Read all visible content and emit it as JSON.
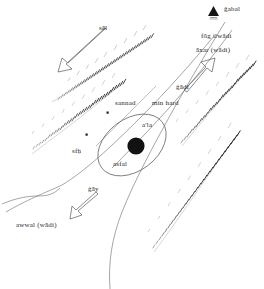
{
  "figure": {
    "type": "hand-drawn-schematic-map",
    "background_color": "#ffffff",
    "ink_color": "#3a3a3a"
  },
  "legend": {
    "symbol_name": "mountain-triangle",
    "label": "ǧabal"
  },
  "labels": {
    "sel": "sēl",
    "fog_ilwadi": "fōg ilwādi",
    "axar_wadi": "āxar (wādi)",
    "gadi": "ġādi",
    "sannad": "sannad",
    "min_hard": "min hard",
    "ala": "a'la",
    "asfal": "asfal",
    "sfh": "sfḥ",
    "gay": "ġāy",
    "awwal_wadi": "awwal (wādi)"
  },
  "arrows": [
    {
      "name": "sel-arrow",
      "label": "sēl",
      "direction": "down-left"
    },
    {
      "name": "gadi-arrow",
      "label": "ġādi",
      "direction": "up-right"
    },
    {
      "name": "gay-arrow",
      "label": "ġāy",
      "direction": "down-left"
    }
  ],
  "features": {
    "center_point_name": "village-dot",
    "ellipse_name": "settlement-ellipse",
    "ridge_count": 4,
    "valley_line_count": 3,
    "marker_dots": 2
  }
}
